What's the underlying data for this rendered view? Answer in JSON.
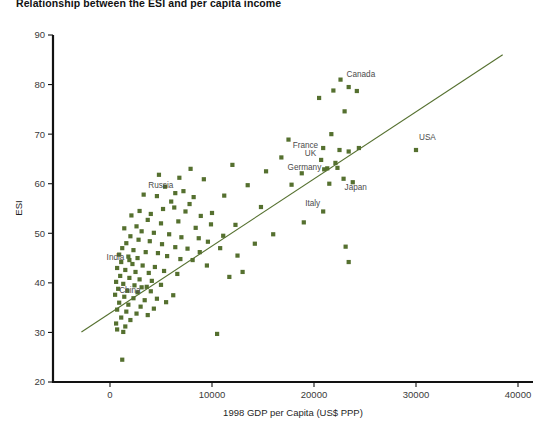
{
  "chart_data": {
    "type": "scatter",
    "title": "Relationship between the ESI and per capita income",
    "xlabel": "1998 GDP per Capita (US$ PPP)",
    "ylabel": "ESI",
    "xlim": [
      -3000,
      41500
    ],
    "ylim": [
      20,
      90
    ],
    "xticks": [
      0,
      10000,
      20000,
      30000,
      40000
    ],
    "xtick_labels": [
      "0",
      "10000",
      "20000",
      "30000",
      "40000"
    ],
    "yticks": [
      20,
      30,
      40,
      50,
      60,
      70,
      80,
      90
    ],
    "ytick_labels": [
      "20",
      "30",
      "40",
      "50",
      "60",
      "70",
      "80",
      "90"
    ],
    "grid": false,
    "legend": null,
    "marker": {
      "shape": "square",
      "size": 4.2,
      "color": "#55702f"
    },
    "trendline": {
      "type": "line",
      "color": "#55702f",
      "width": 1.1,
      "x": [
        -2800,
        38500
      ],
      "y": [
        30.1,
        86.0
      ]
    },
    "annotations": [
      {
        "label": "Canada",
        "x": 22600,
        "y": 81.0
      },
      {
        "label": "France",
        "x": 20900,
        "y": 67.2
      },
      {
        "label": "UK",
        "x": 20700,
        "y": 64.8
      },
      {
        "label": "Germany",
        "x": 21300,
        "y": 63.1
      },
      {
        "label": "Japan",
        "x": 22900,
        "y": 61.0
      },
      {
        "label": "USA",
        "x": 30000,
        "y": 66.8
      },
      {
        "label": "Italy",
        "x": 20900,
        "y": 54.4
      },
      {
        "label": "Russia",
        "x": 6400,
        "y": 58.1
      },
      {
        "label": "India",
        "x": 1900,
        "y": 44.6
      },
      {
        "label": "China",
        "x": 3100,
        "y": 39.1
      }
    ],
    "points": [
      {
        "x": 22600,
        "y": 81.0,
        "label": "Canada"
      },
      {
        "x": 20900,
        "y": 67.2,
        "label": "France"
      },
      {
        "x": 20700,
        "y": 64.8,
        "label": "UK"
      },
      {
        "x": 21300,
        "y": 63.1,
        "label": "Germany"
      },
      {
        "x": 22900,
        "y": 61.0,
        "label": "Japan"
      },
      {
        "x": 30000,
        "y": 66.8,
        "label": "USA"
      },
      {
        "x": 20900,
        "y": 54.4,
        "label": "Italy"
      },
      {
        "x": 6400,
        "y": 58.1,
        "label": "Russia"
      },
      {
        "x": 1900,
        "y": 44.6,
        "label": "India"
      },
      {
        "x": 3100,
        "y": 39.1,
        "label": "China"
      },
      {
        "x": 21900,
        "y": 78.8
      },
      {
        "x": 24200,
        "y": 78.7
      },
      {
        "x": 20500,
        "y": 77.3
      },
      {
        "x": 23400,
        "y": 79.5
      },
      {
        "x": 23000,
        "y": 74.6
      },
      {
        "x": 17500,
        "y": 68.9
      },
      {
        "x": 21700,
        "y": 70.0
      },
      {
        "x": 22500,
        "y": 66.8
      },
      {
        "x": 23400,
        "y": 66.5
      },
      {
        "x": 24400,
        "y": 67.2
      },
      {
        "x": 22100,
        "y": 64.2
      },
      {
        "x": 21000,
        "y": 62.9
      },
      {
        "x": 22300,
        "y": 63.2
      },
      {
        "x": 21500,
        "y": 60.0
      },
      {
        "x": 23800,
        "y": 60.3
      },
      {
        "x": 23100,
        "y": 47.3
      },
      {
        "x": 23400,
        "y": 44.2
      },
      {
        "x": 13500,
        "y": 59.7
      },
      {
        "x": 14800,
        "y": 55.3
      },
      {
        "x": 11200,
        "y": 57.6
      },
      {
        "x": 10000,
        "y": 54.1
      },
      {
        "x": 9900,
        "y": 51.8
      },
      {
        "x": 12300,
        "y": 51.7
      },
      {
        "x": 11100,
        "y": 49.5
      },
      {
        "x": 8900,
        "y": 53.5
      },
      {
        "x": 7800,
        "y": 55.9
      },
      {
        "x": 6800,
        "y": 61.2
      },
      {
        "x": 5400,
        "y": 59.4
      },
      {
        "x": 7200,
        "y": 58.5
      },
      {
        "x": 8200,
        "y": 57.3
      },
      {
        "x": 6000,
        "y": 56.4
      },
      {
        "x": 4600,
        "y": 57.5
      },
      {
        "x": 3300,
        "y": 57.8
      },
      {
        "x": 6300,
        "y": 55.2
      },
      {
        "x": 7400,
        "y": 54.4
      },
      {
        "x": 5200,
        "y": 54.9
      },
      {
        "x": 4000,
        "y": 53.9
      },
      {
        "x": 2900,
        "y": 54.5
      },
      {
        "x": 2100,
        "y": 53.6
      },
      {
        "x": 3700,
        "y": 52.7
      },
      {
        "x": 5000,
        "y": 52.0
      },
      {
        "x": 6700,
        "y": 52.4
      },
      {
        "x": 8400,
        "y": 51.1
      },
      {
        "x": 2600,
        "y": 51.4
      },
      {
        "x": 1400,
        "y": 51.0
      },
      {
        "x": 3100,
        "y": 50.4
      },
      {
        "x": 4300,
        "y": 50.1
      },
      {
        "x": 5800,
        "y": 49.8
      },
      {
        "x": 7000,
        "y": 49.2
      },
      {
        "x": 8700,
        "y": 49.0
      },
      {
        "x": 9600,
        "y": 48.3
      },
      {
        "x": 2000,
        "y": 49.4
      },
      {
        "x": 2800,
        "y": 48.7
      },
      {
        "x": 3900,
        "y": 48.4
      },
      {
        "x": 1600,
        "y": 48.0
      },
      {
        "x": 5100,
        "y": 47.8
      },
      {
        "x": 6400,
        "y": 47.2
      },
      {
        "x": 7600,
        "y": 46.9
      },
      {
        "x": 1200,
        "y": 47.0
      },
      {
        "x": 2300,
        "y": 46.6
      },
      {
        "x": 3500,
        "y": 46.2
      },
      {
        "x": 4700,
        "y": 46.0
      },
      {
        "x": 900,
        "y": 45.7
      },
      {
        "x": 1800,
        "y": 45.3
      },
      {
        "x": 2700,
        "y": 45.0
      },
      {
        "x": 5600,
        "y": 45.4
      },
      {
        "x": 6900,
        "y": 44.8
      },
      {
        "x": 8100,
        "y": 44.6
      },
      {
        "x": 1100,
        "y": 44.2
      },
      {
        "x": 2200,
        "y": 43.8
      },
      {
        "x": 3200,
        "y": 43.5
      },
      {
        "x": 4400,
        "y": 43.2
      },
      {
        "x": 700,
        "y": 43.0
      },
      {
        "x": 1500,
        "y": 42.6
      },
      {
        "x": 2500,
        "y": 42.2
      },
      {
        "x": 3800,
        "y": 42.0
      },
      {
        "x": 5300,
        "y": 42.4
      },
      {
        "x": 6600,
        "y": 41.8
      },
      {
        "x": 1000,
        "y": 41.4
      },
      {
        "x": 1900,
        "y": 41.0
      },
      {
        "x": 2900,
        "y": 40.7
      },
      {
        "x": 4100,
        "y": 40.4
      },
      {
        "x": 600,
        "y": 40.2
      },
      {
        "x": 1300,
        "y": 39.8
      },
      {
        "x": 2400,
        "y": 39.5
      },
      {
        "x": 3600,
        "y": 39.2
      },
      {
        "x": 5000,
        "y": 39.6
      },
      {
        "x": 800,
        "y": 38.8
      },
      {
        "x": 1700,
        "y": 38.4
      },
      {
        "x": 2700,
        "y": 38.1
      },
      {
        "x": 4000,
        "y": 38.3
      },
      {
        "x": 500,
        "y": 37.6
      },
      {
        "x": 1400,
        "y": 37.2
      },
      {
        "x": 2300,
        "y": 36.9
      },
      {
        "x": 3400,
        "y": 36.5
      },
      {
        "x": 4600,
        "y": 36.8
      },
      {
        "x": 900,
        "y": 36.0
      },
      {
        "x": 1800,
        "y": 35.6
      },
      {
        "x": 3000,
        "y": 35.2
      },
      {
        "x": 700,
        "y": 34.6
      },
      {
        "x": 1600,
        "y": 34.2
      },
      {
        "x": 2600,
        "y": 33.8
      },
      {
        "x": 1100,
        "y": 33.0
      },
      {
        "x": 2000,
        "y": 32.5
      },
      {
        "x": 600,
        "y": 31.8
      },
      {
        "x": 1500,
        "y": 31.2
      },
      {
        "x": 700,
        "y": 30.6
      },
      {
        "x": 1300,
        "y": 30.1
      },
      {
        "x": 10500,
        "y": 29.7
      },
      {
        "x": 1200,
        "y": 24.5
      },
      {
        "x": 16000,
        "y": 49.8
      },
      {
        "x": 13000,
        "y": 42.2
      },
      {
        "x": 19000,
        "y": 52.2
      },
      {
        "x": 17800,
        "y": 59.8
      },
      {
        "x": 15300,
        "y": 62.5
      },
      {
        "x": 9200,
        "y": 60.9
      },
      {
        "x": 4800,
        "y": 61.8
      },
      {
        "x": 7900,
        "y": 63.0
      },
      {
        "x": 12500,
        "y": 45.5
      },
      {
        "x": 10800,
        "y": 47.0
      },
      {
        "x": 6200,
        "y": 37.5
      },
      {
        "x": 5500,
        "y": 36.1
      },
      {
        "x": 4300,
        "y": 34.8
      },
      {
        "x": 8800,
        "y": 46.2
      },
      {
        "x": 3700,
        "y": 33.5
      },
      {
        "x": 14200,
        "y": 47.9
      },
      {
        "x": 18800,
        "y": 62.1
      },
      {
        "x": 16800,
        "y": 65.3
      },
      {
        "x": 12000,
        "y": 63.8
      },
      {
        "x": 9500,
        "y": 43.5
      },
      {
        "x": 11700,
        "y": 41.2
      }
    ]
  }
}
